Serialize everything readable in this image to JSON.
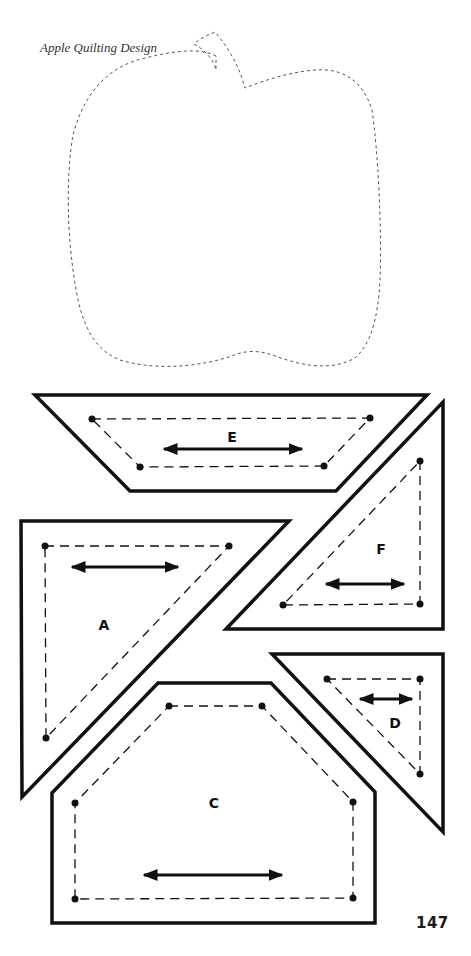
{
  "page": {
    "title": "Apple Quilting Design",
    "page_number": "147"
  },
  "template": {
    "name": "apple",
    "outline_style": "dashed"
  },
  "pieces": [
    {
      "id": "E",
      "label": "E",
      "shape": "trapezoid",
      "grain_arrow": "horizontal"
    },
    {
      "id": "F",
      "label": "F",
      "shape": "right-triangle",
      "grain_arrow": "horizontal"
    },
    {
      "id": "A",
      "label": "A",
      "shape": "right-triangle",
      "grain_arrow": "horizontal"
    },
    {
      "id": "D",
      "label": "D",
      "shape": "right-triangle",
      "grain_arrow": "horizontal"
    },
    {
      "id": "C",
      "label": "C",
      "shape": "pentagon",
      "grain_arrow": "horizontal"
    }
  ],
  "colors": {
    "line": "#111111",
    "dashed_outline": "#555555",
    "background": "#ffffff"
  }
}
